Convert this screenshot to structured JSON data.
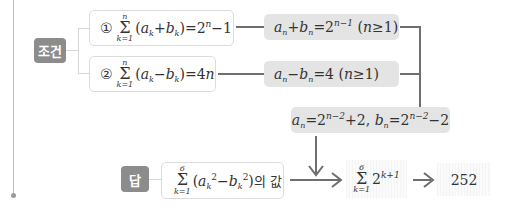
{
  "labels": {
    "condition_badge": "조건",
    "answer_badge": "답"
  },
  "conditions": [
    {
      "marker": "①",
      "sum_upper": "n",
      "sum_lower": "k=1",
      "expression": "(a_k+b_k)=2^n−1",
      "result": "a_n+b_n=2^{n−1} (n≥1)"
    },
    {
      "marker": "②",
      "sum_upper": "n",
      "sum_lower": "k=1",
      "expression": "(a_k−b_k)=4n",
      "result": "a_n−b_n=4 (n≥1)"
    }
  ],
  "combined_result": "a_n=2^{n−2}+2, b_n=2^{n−2}−2",
  "answer": {
    "sum_upper": "6",
    "sum_lower": "k=1",
    "expression": "(a_k^2−b_k^2)",
    "suffix": "의 값",
    "intermediate_sum_upper": "6",
    "intermediate_sum_lower": "k=1",
    "intermediate_expression": "2^{k+1}",
    "final_value": "252"
  },
  "colors": {
    "badge": "#8c8c8c",
    "result_box": "#e4e4e4",
    "connector": "#6e6e6e",
    "margin_line": "#bdbdbd"
  }
}
